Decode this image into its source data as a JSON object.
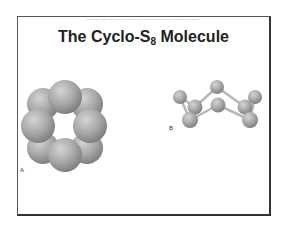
{
  "slide": {
    "copyright": "Copyright © The McGraw-Hill Companies, Inc. Permission required for reproduction or display.",
    "title_main": "The Cyclo-S",
    "title_subscript": "8",
    "title_suffix": " Molecule",
    "figure_a_label": "A",
    "figure_b_label": "B"
  },
  "figure_a": {
    "description": "Space-filling model of cyclo-S8 (top view)",
    "atom_count": 8,
    "atom_color": "#a8a8a8"
  },
  "figure_b": {
    "description": "Ball-and-stick model of cyclo-S8 crown shape (side view)",
    "atom_count": 8,
    "atom_color": "#a8a8a8",
    "bond_color": "#b8b8b8"
  }
}
